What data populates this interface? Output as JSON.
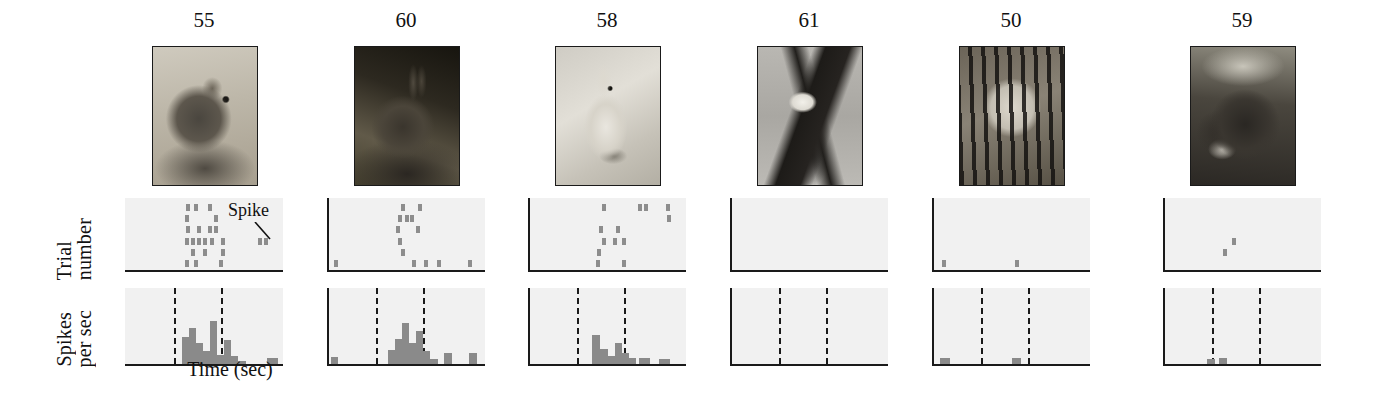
{
  "figure": {
    "axis_labels": {
      "y_raster_line1": "Trial",
      "y_raster_line2": "number",
      "y_psth_line1": "Spikes",
      "y_psth_line2": "per sec",
      "x_title": "Time (sec)"
    },
    "annotation": {
      "label": "Spike"
    },
    "colors": {
      "spike": "#8d8d8d",
      "bar": "#8a8a8a",
      "axis": "#1a1a1a",
      "panel_background": "#f1f1f1",
      "page_background": "#ffffff"
    }
  },
  "chart_data": {
    "type": "raster-psth",
    "title": "",
    "xlabel": "Time (sec)",
    "ylabel_raster": "Trial number",
    "ylabel_psth": "Spikes per sec",
    "stimulus_onset_fraction": 0.3,
    "stimulus_offset_fraction": 0.6,
    "panels": [
      {
        "label": "55",
        "stimulus": "mouse",
        "stimulus_alt": "grayscale photo of a mouse on a rock",
        "image_style": "ph-mouse",
        "has_left_axis": false,
        "raster_spikes": [
          {
            "x": 0.38,
            "trial": 0
          },
          {
            "x": 0.43,
            "trial": 0
          },
          {
            "x": 0.52,
            "trial": 0
          },
          {
            "x": 0.37,
            "trial": 1
          },
          {
            "x": 0.56,
            "trial": 1
          },
          {
            "x": 0.38,
            "trial": 2
          },
          {
            "x": 0.45,
            "trial": 2
          },
          {
            "x": 0.52,
            "trial": 2
          },
          {
            "x": 0.56,
            "trial": 2
          },
          {
            "x": 0.37,
            "trial": 3
          },
          {
            "x": 0.41,
            "trial": 3
          },
          {
            "x": 0.45,
            "trial": 3
          },
          {
            "x": 0.49,
            "trial": 3
          },
          {
            "x": 0.53,
            "trial": 3
          },
          {
            "x": 0.6,
            "trial": 3
          },
          {
            "x": 0.84,
            "trial": 3
          },
          {
            "x": 0.88,
            "trial": 3
          },
          {
            "x": 0.41,
            "trial": 4
          },
          {
            "x": 0.49,
            "trial": 4
          },
          {
            "x": 0.6,
            "trial": 4
          },
          {
            "x": 0.37,
            "trial": 5
          },
          {
            "x": 0.43,
            "trial": 5
          },
          {
            "x": 0.59,
            "trial": 5
          }
        ],
        "psth_bars": [
          {
            "x": 0.35,
            "w": 0.045,
            "h": 0.38
          },
          {
            "x": 0.395,
            "w": 0.045,
            "h": 0.52
          },
          {
            "x": 0.44,
            "w": 0.045,
            "h": 0.3
          },
          {
            "x": 0.485,
            "w": 0.045,
            "h": 0.18
          },
          {
            "x": 0.53,
            "w": 0.045,
            "h": 0.62
          },
          {
            "x": 0.575,
            "w": 0.045,
            "h": 0.13
          },
          {
            "x": 0.62,
            "w": 0.045,
            "h": 0.34
          },
          {
            "x": 0.665,
            "w": 0.045,
            "h": 0.12
          },
          {
            "x": 0.71,
            "w": 0.05,
            "h": 0.05
          },
          {
            "x": 0.9,
            "w": 0.07,
            "h": 0.08
          }
        ]
      },
      {
        "label": "60",
        "stimulus": "rabbit",
        "stimulus_alt": "grayscale photo of a rabbit in brush",
        "image_style": "ph-rabbit",
        "has_left_axis": true,
        "raster_spikes": [
          {
            "x": 0.46,
            "trial": 0
          },
          {
            "x": 0.57,
            "trial": 0
          },
          {
            "x": 0.44,
            "trial": 1
          },
          {
            "x": 0.49,
            "trial": 1
          },
          {
            "x": 0.52,
            "trial": 1
          },
          {
            "x": 0.43,
            "trial": 2
          },
          {
            "x": 0.56,
            "trial": 2
          },
          {
            "x": 0.44,
            "trial": 3
          },
          {
            "x": 0.46,
            "trial": 4
          },
          {
            "x": 0.03,
            "trial": 5
          },
          {
            "x": 0.53,
            "trial": 5
          },
          {
            "x": 0.61,
            "trial": 5
          },
          {
            "x": 0.69,
            "trial": 5
          },
          {
            "x": 0.89,
            "trial": 5
          }
        ],
        "psth_bars": [
          {
            "x": 0.01,
            "w": 0.05,
            "h": 0.1
          },
          {
            "x": 0.38,
            "w": 0.045,
            "h": 0.2
          },
          {
            "x": 0.425,
            "w": 0.045,
            "h": 0.36
          },
          {
            "x": 0.47,
            "w": 0.045,
            "h": 0.58
          },
          {
            "x": 0.515,
            "w": 0.045,
            "h": 0.3
          },
          {
            "x": 0.56,
            "w": 0.045,
            "h": 0.47
          },
          {
            "x": 0.605,
            "w": 0.045,
            "h": 0.18
          },
          {
            "x": 0.65,
            "w": 0.05,
            "h": 0.07
          },
          {
            "x": 0.74,
            "w": 0.05,
            "h": 0.16
          },
          {
            "x": 0.9,
            "w": 0.05,
            "h": 0.16
          }
        ]
      },
      {
        "label": "58",
        "stimulus": "hare",
        "stimulus_alt": "grayscale photo of a white hare in snow",
        "image_style": "ph-hare",
        "has_left_axis": true,
        "raster_spikes": [
          {
            "x": 0.46,
            "trial": 0
          },
          {
            "x": 0.69,
            "trial": 0
          },
          {
            "x": 0.73,
            "trial": 0
          },
          {
            "x": 0.87,
            "trial": 0
          },
          {
            "x": 0.88,
            "trial": 1
          },
          {
            "x": 0.44,
            "trial": 2
          },
          {
            "x": 0.55,
            "trial": 2
          },
          {
            "x": 0.46,
            "trial": 3
          },
          {
            "x": 0.53,
            "trial": 3
          },
          {
            "x": 0.59,
            "trial": 3
          },
          {
            "x": 0.43,
            "trial": 4
          },
          {
            "x": 0.42,
            "trial": 5
          },
          {
            "x": 0.59,
            "trial": 5
          }
        ],
        "psth_bars": [
          {
            "x": 0.4,
            "w": 0.05,
            "h": 0.42
          },
          {
            "x": 0.45,
            "w": 0.05,
            "h": 0.22
          },
          {
            "x": 0.5,
            "w": 0.045,
            "h": 0.12
          },
          {
            "x": 0.545,
            "w": 0.045,
            "h": 0.3
          },
          {
            "x": 0.59,
            "w": 0.045,
            "h": 0.16
          },
          {
            "x": 0.635,
            "w": 0.045,
            "h": 0.08
          },
          {
            "x": 0.7,
            "w": 0.07,
            "h": 0.09
          },
          {
            "x": 0.83,
            "w": 0.07,
            "h": 0.07
          }
        ]
      },
      {
        "label": "61",
        "stimulus": "eagle",
        "stimulus_alt": "grayscale photo of a bald eagle in flight",
        "image_style": "ph-eagle",
        "has_left_axis": true,
        "raster_spikes": [],
        "psth_bars": []
      },
      {
        "label": "50",
        "stimulus": "tiger",
        "stimulus_alt": "grayscale photo of a tiger face",
        "image_style": "ph-tiger",
        "has_left_axis": true,
        "raster_spikes": [
          {
            "x": 0.05,
            "trial": 5
          },
          {
            "x": 0.52,
            "trial": 5
          }
        ],
        "psth_bars": [
          {
            "x": 0.04,
            "w": 0.06,
            "h": 0.09
          },
          {
            "x": 0.5,
            "w": 0.06,
            "h": 0.09
          }
        ]
      },
      {
        "label": "59",
        "stimulus": "rhinoceros",
        "stimulus_alt": "grayscale photo of rhinoceroses",
        "image_style": "ph-rhino",
        "has_left_axis": true,
        "raster_spikes": [
          {
            "x": 0.37,
            "trial": 4
          },
          {
            "x": 0.43,
            "trial": 3
          }
        ],
        "psth_bars": [
          {
            "x": 0.27,
            "w": 0.05,
            "h": 0.07
          },
          {
            "x": 0.345,
            "w": 0.05,
            "h": 0.08
          }
        ]
      }
    ]
  }
}
